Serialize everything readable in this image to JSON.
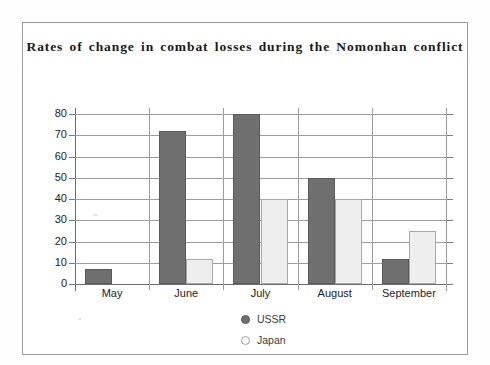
{
  "chart_data": {
    "type": "bar",
    "title": "Rates of change in combat losses during the Nomonhan conflict",
    "xlabel": "",
    "ylabel": "",
    "categories": [
      "May",
      "June",
      "July",
      "August",
      "September"
    ],
    "series": [
      {
        "name": "USSR",
        "color": "#6f6f6f",
        "values": [
          7,
          72,
          80,
          50,
          12
        ]
      },
      {
        "name": "Japan",
        "color": "#eeeeee",
        "values": [
          0,
          12,
          40,
          40,
          25
        ]
      }
    ],
    "ylim": [
      0,
      80
    ],
    "yticks": [
      0,
      10,
      20,
      30,
      40,
      50,
      60,
      70,
      80
    ],
    "ytick_labels": [
      "0",
      "10",
      "20",
      "30",
      "40",
      "50",
      "60",
      "70",
      "80"
    ],
    "grid": true,
    "legend_position": "bottom-center"
  },
  "legend": {
    "items": [
      {
        "label": "USSR",
        "marker": "filled-circle-icon"
      },
      {
        "label": "Japan",
        "marker": "open-circle-icon"
      }
    ]
  }
}
